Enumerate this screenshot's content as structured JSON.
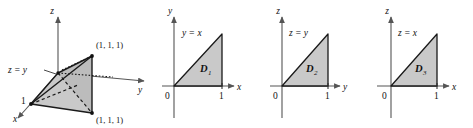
{
  "figure": {
    "background_color": "#ffffff",
    "ink_color": "#111111",
    "shade_color": "#c9c9c9",
    "axis_color": "#555555"
  },
  "panels": [
    {
      "id": "tetrahedron",
      "type": "3d-solid",
      "axes": {
        "x": "x",
        "y": "y",
        "z": "z"
      },
      "plane_label": "z = y",
      "tick_label": "1",
      "vertex_labels": [
        {
          "text": "(1, 1, 1)",
          "position": "upper-right"
        },
        {
          "text": "(1, 1, 1)",
          "position": "lower-right"
        }
      ]
    },
    {
      "id": "d1",
      "type": "2d-region",
      "axes": {
        "horizontal": "x",
        "vertical": "y"
      },
      "line_label": "y = x",
      "region_label": "D",
      "region_subscript": "1",
      "origin_label": "0",
      "tick_label": "1"
    },
    {
      "id": "d2",
      "type": "2d-region",
      "axes": {
        "horizontal": "y",
        "vertical": "z"
      },
      "line_label": "z = y",
      "region_label": "D",
      "region_subscript": "2",
      "origin_label": "0",
      "tick_label": "1"
    },
    {
      "id": "d3",
      "type": "2d-region",
      "axes": {
        "horizontal": "x",
        "vertical": "z"
      },
      "line_label": "z = x",
      "region_label": "D",
      "region_subscript": "3",
      "origin_label": "0",
      "tick_label": "1"
    }
  ]
}
